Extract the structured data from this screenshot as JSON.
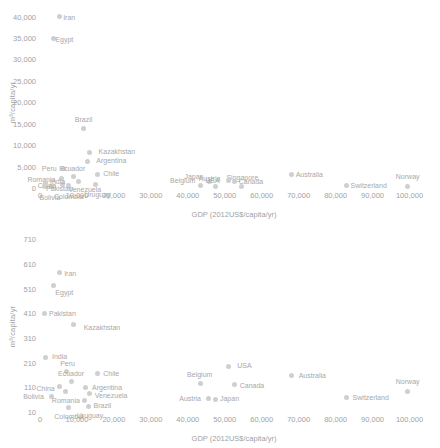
{
  "chart_data": [
    {
      "id": "top",
      "type": "scatter",
      "title": "",
      "xlabel": "GDP (2012US$/capita/yr)",
      "ylabel": "m³/capita/yr",
      "xlim": [
        0,
        105000
      ],
      "ylim": [
        0,
        42000
      ],
      "grid": false,
      "legend": "none",
      "xticks": [
        "0",
        "10,000",
        "20,000",
        "30,000",
        "40,000",
        "50,000",
        "60,000",
        "70,000",
        "80,000",
        "90,000",
        "100,000"
      ],
      "xtickvals": [
        0,
        10000,
        20000,
        30000,
        40000,
        50000,
        60000,
        70000,
        80000,
        90000,
        100000
      ],
      "yticks": [
        "0",
        "5,000",
        "10,000",
        "15,000",
        "20,000",
        "25,000",
        "30,000",
        "35,000",
        "40,000"
      ],
      "ytickvals": [
        0,
        5000,
        10000,
        15000,
        20000,
        25000,
        30000,
        35000,
        40000
      ],
      "points": [
        {
          "label": "Iran",
          "x": 5200,
          "y": 40000,
          "lx": 10,
          "ly": 0
        },
        {
          "label": "Egypt",
          "x": 3600,
          "y": 35000,
          "lx": 11,
          "ly": 1
        },
        {
          "label": "Brazil",
          "x": 11800,
          "y": 14000,
          "lx": 0,
          "ly": -9
        },
        {
          "label": "Kazakhstan",
          "x": 13500,
          "y": 8300,
          "lx": 27,
          "ly": -1
        },
        {
          "label": "Argentina",
          "x": 12800,
          "y": 6200,
          "lx": 24,
          "ly": -1
        },
        {
          "label": "Peru",
          "x": 6300,
          "y": 4500,
          "lx": -14,
          "ly": -1
        },
        {
          "label": "Chile",
          "x": 15500,
          "y": 3200,
          "lx": 14,
          "ly": -1
        },
        {
          "label": "Ecuador",
          "x": 9000,
          "y": 2700,
          "lx": -1,
          "ly": -8
        },
        {
          "label": "Romania",
          "x": 5800,
          "y": 2200,
          "lx": -20,
          "ly": 0
        },
        {
          "label": "Venezuela",
          "x": 10500,
          "y": 1500,
          "lx": 6,
          "ly": 7
        },
        {
          "label": "Uruguay",
          "x": 15000,
          "y": 800,
          "lx": 2,
          "ly": 9
        },
        {
          "label": "Colombia",
          "x": 7800,
          "y": 500,
          "lx": 0,
          "ly": 10
        },
        {
          "label": "Bolivia",
          "x": 3200,
          "y": 300,
          "lx": -2,
          "ly": 10
        },
        {
          "label": "Japan",
          "x": 46000,
          "y": 1500,
          "lx": -16,
          "ly": -6
        },
        {
          "label": "Belgium",
          "x": 43500,
          "y": 600,
          "lx": -18,
          "ly": -5
        },
        {
          "label": "Austria",
          "x": 47500,
          "y": 300,
          "lx": -6,
          "ly": -9
        },
        {
          "label": "Australia",
          "x": 68000,
          "y": 3100,
          "lx": 18,
          "ly": -1
        },
        {
          "label": "Canada",
          "x": 52500,
          "y": 1600,
          "lx": 17,
          "ly": 0
        },
        {
          "label": "Singapore",
          "x": 54500,
          "y": 400,
          "lx": 1,
          "ly": -9
        },
        {
          "label": "Switzerland",
          "x": 83000,
          "y": 500,
          "lx": 22,
          "ly": -1
        },
        {
          "label": "Norway",
          "x": 99500,
          "y": 400,
          "lx": 0,
          "ly": -10
        },
        {
          "label": "USA",
          "x": 51000,
          "y": 1700,
          "lx": -16,
          "ly": -1
        },
        {
          "label": "China",
          "x": 6200,
          "y": 900,
          "lx": -16,
          "ly": 1
        },
        {
          "label": "India",
          "x": 1500,
          "y": 1200,
          "lx": 12,
          "ly": -2
        },
        {
          "label": "Pakistan",
          "x": 1200,
          "y": 400,
          "lx": 15,
          "ly": 2
        }
      ]
    },
    {
      "id": "bottom",
      "type": "scatter",
      "title": "",
      "xlabel": "GDP (2012US$/capita/yr)",
      "ylabel": "m³/capita/yr",
      "xlim": [
        0,
        105000
      ],
      "ylim": [
        10,
        740
      ],
      "grid": false,
      "legend": "none",
      "xticks": [
        "0",
        "10,000",
        "20,000",
        "30,000",
        "40,000",
        "50,000",
        "60,000",
        "70,000",
        "80,000",
        "90,000",
        "100,000"
      ],
      "xtickvals": [
        0,
        10000,
        20000,
        30000,
        40000,
        50000,
        60000,
        70000,
        80000,
        90000,
        100000
      ],
      "yticks": [
        "10",
        "110",
        "210",
        "310",
        "410",
        "510",
        "610",
        "710"
      ],
      "ytickvals": [
        10,
        110,
        210,
        310,
        410,
        510,
        610,
        710
      ],
      "points": [
        {
          "label": "Iran",
          "x": 5200,
          "y": 575,
          "lx": 11,
          "ly": 0
        },
        {
          "label": "Egypt",
          "x": 3600,
          "y": 525,
          "lx": 11,
          "ly": 7
        },
        {
          "label": "Pakistan",
          "x": 1200,
          "y": 410,
          "lx": 18,
          "ly": 0
        },
        {
          "label": "Kazakhstan",
          "x": 9200,
          "y": 365,
          "lx": 28,
          "ly": 3
        },
        {
          "label": "India",
          "x": 1500,
          "y": 230,
          "lx": 14,
          "ly": -2
        },
        {
          "label": "Peru",
          "x": 7200,
          "y": 175,
          "lx": 1,
          "ly": -8
        },
        {
          "label": "Chile",
          "x": 15500,
          "y": 165,
          "lx": 14,
          "ly": -1
        },
        {
          "label": "Ecuador",
          "x": 8400,
          "y": 135,
          "lx": 0,
          "ly": -8
        },
        {
          "label": "China",
          "x": 5300,
          "y": 112,
          "lx": -14,
          "ly": 1
        },
        {
          "label": "Romania",
          "x": 7000,
          "y": 92,
          "lx": 0,
          "ly": 8
        },
        {
          "label": "Argentina",
          "x": 12200,
          "y": 110,
          "lx": 22,
          "ly": 0
        },
        {
          "label": "Venezuela",
          "x": 13300,
          "y": 85,
          "lx": 22,
          "ly": 1
        },
        {
          "label": "Bolivia",
          "x": 3100,
          "y": 72,
          "lx": -18,
          "ly": -1
        },
        {
          "label": "Brazil",
          "x": 12000,
          "y": 55,
          "lx": 18,
          "ly": 4
        },
        {
          "label": "Colombia",
          "x": 7600,
          "y": 30,
          "lx": 1,
          "ly": 9
        },
        {
          "label": "Uruguay",
          "x": 13000,
          "y": 32,
          "lx": 2,
          "ly": 8
        },
        {
          "label": "USA",
          "x": 51000,
          "y": 195,
          "lx": 16,
          "ly": -1
        },
        {
          "label": "Australia",
          "x": 68000,
          "y": 160,
          "lx": 21,
          "ly": 0
        },
        {
          "label": "Belgium",
          "x": 43500,
          "y": 125,
          "lx": -1,
          "ly": -10
        },
        {
          "label": "Canada",
          "x": 52500,
          "y": 120,
          "lx": 18,
          "ly": 0
        },
        {
          "label": "Norway",
          "x": 99500,
          "y": 95,
          "lx": 0,
          "ly": -10
        },
        {
          "label": "Austria",
          "x": 45500,
          "y": 65,
          "lx": -18,
          "ly": 0
        },
        {
          "label": "Japan",
          "x": 47500,
          "y": 62,
          "lx": 14,
          "ly": -1
        },
        {
          "label": "Switzerland",
          "x": 83000,
          "y": 70,
          "lx": 24,
          "ly": 0
        }
      ]
    }
  ]
}
